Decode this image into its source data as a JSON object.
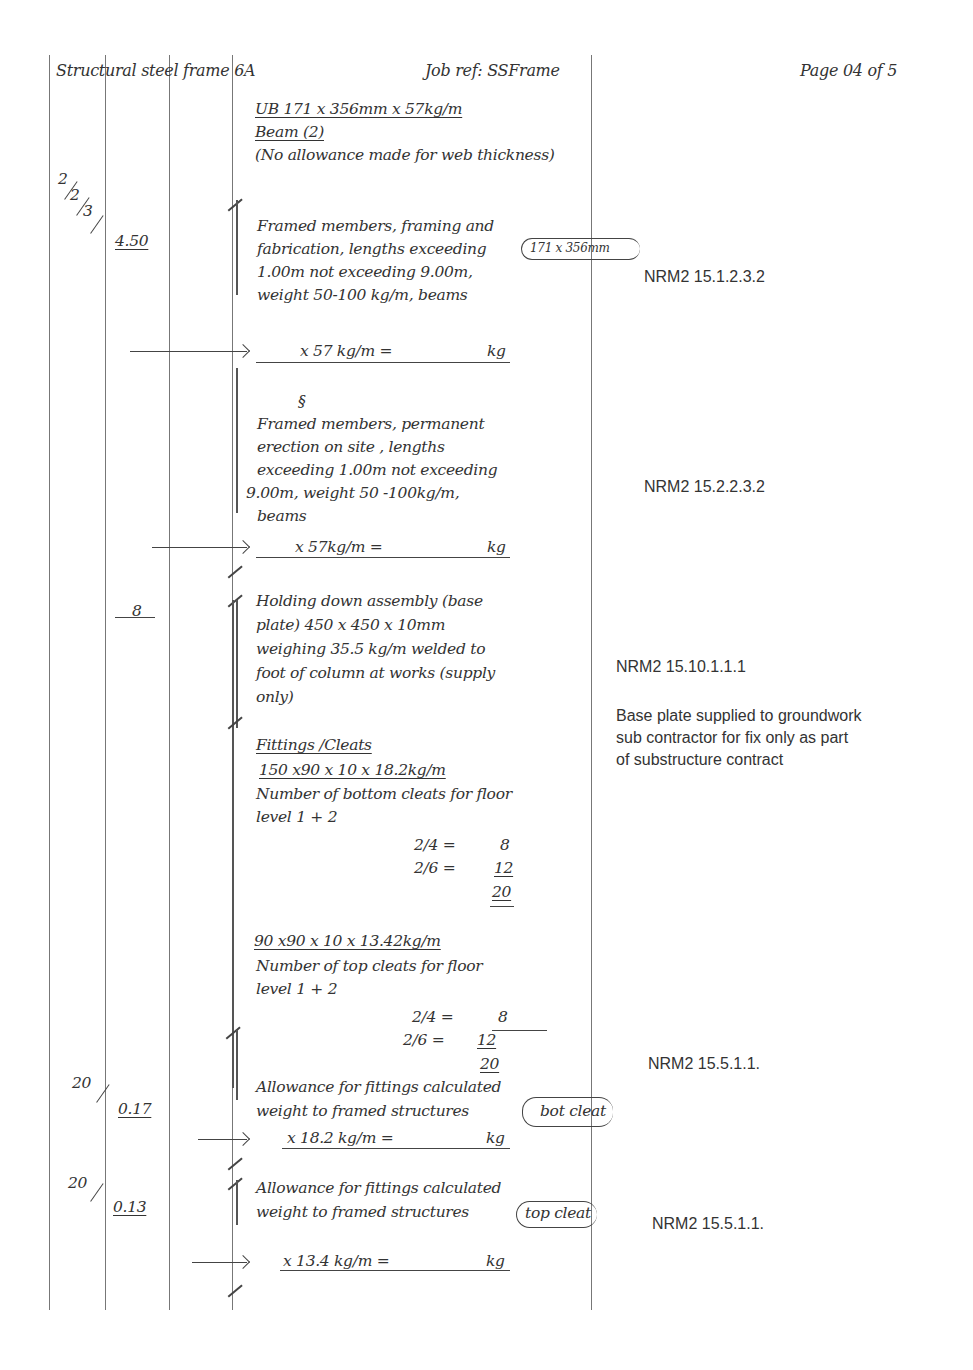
{
  "header": {
    "title": "Structural steel frame 6A",
    "job_ref": "Job ref: SSFrame",
    "page": "Page 04 of 5"
  },
  "columns": {
    "lines_x": [
      49,
      105,
      169,
      232,
      591
    ]
  },
  "section": {
    "heading": "UB 171 x 356mm x 57kg/m",
    "subheading": "Beam (2)",
    "note": "(No allowance made for web thickness)"
  },
  "items": [
    {
      "timesing": [
        "2",
        "2",
        "3"
      ],
      "dimension": "4.50",
      "description": [
        "Framed members, framing and",
        "fabrication, lengths exceeding",
        "1.00m not exceeding 9.00m,",
        "weight 50-100 kg/m, beams"
      ],
      "annotation": "171 x 356mm",
      "calc": "x 57 kg/m =",
      "calc_unit": "kg",
      "reference": "NRM2 15.1.2.3.2"
    },
    {
      "ditto": "§",
      "description": [
        "Framed members, permanent",
        "erection on site , lengths",
        "exceeding 1.00m not exceeding",
        "9.00m, weight 50 -100kg/m,",
        "beams"
      ],
      "calc": "x 57kg/m =",
      "calc_unit": "kg",
      "reference": "NRM2 15.2.2.3.2"
    },
    {
      "dimension": "8",
      "description": [
        "Holding down assembly (base",
        "plate) 450 x 450 x 10mm",
        "weighing 35.5 kg/m welded to",
        "foot of column at works (supply",
        "only)"
      ],
      "reference": "NRM2 15.10.1.1.1",
      "side_note": [
        "Base plate supplied to groundwork",
        "sub contractor for fix only as part",
        "of substructure contract"
      ]
    }
  ],
  "fittings": {
    "heading": "Fittings /Cleats",
    "bottom": {
      "size": "150 x90 x 10 x 18.2kg/m",
      "description": [
        "Number of bottom cleats for floor",
        "level 1 + 2"
      ],
      "calcs": [
        {
          "expr": "2/4 =",
          "value": "8"
        },
        {
          "expr": "2/6 =",
          "value": "12"
        }
      ],
      "total": "20"
    },
    "top": {
      "size": "90 x90 x 10 x 13.42kg/m",
      "description": [
        "Number of top  cleats for floor",
        "level 1 + 2"
      ],
      "calcs": [
        {
          "expr": "2/4 =",
          "value": "8"
        },
        {
          "expr": "2/6 =",
          "value": "12"
        }
      ],
      "total": "20"
    }
  },
  "allowances": [
    {
      "timesing": "20",
      "dimension": "0.17",
      "description": [
        "Allowance for fittings calculated",
        "weight to framed structures"
      ],
      "annotation": "bot cleat",
      "calc": "x  18.2 kg/m =",
      "calc_unit": "kg",
      "reference": "NRM2 15.5.1.1."
    },
    {
      "timesing": "20",
      "dimension": "0.13",
      "description": [
        "Allowance for fittings calculated",
        "weight to framed structures"
      ],
      "annotation": "top cleat",
      "calc": "x  13.4 kg/m =",
      "calc_unit": "kg",
      "reference": "NRM2 15.5.1.1."
    }
  ]
}
